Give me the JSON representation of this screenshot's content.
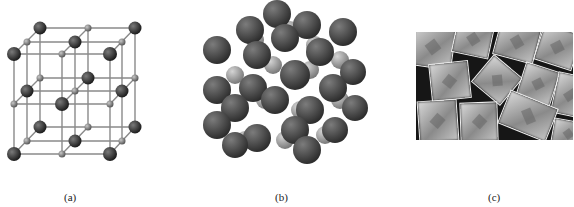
{
  "figure": {
    "panels": [
      {
        "id": "a",
        "label": "(a)",
        "description": "Ball-and-stick lattice model: large dark spheres and small gray spheres at alternating cubic lattice points"
      },
      {
        "id": "b",
        "label": "(b)",
        "description": "Space-filling model: close-packed large dark spheres with small lighter spheres in gaps"
      },
      {
        "id": "c",
        "label": "(c)",
        "description": "Photograph of cubic salt crystals on dark background"
      }
    ]
  },
  "colors": {
    "large_ion": "#3a3a3a",
    "small_ion": "#8c8c8c",
    "bond": "#8a8a8a",
    "background": "#ffffff"
  }
}
